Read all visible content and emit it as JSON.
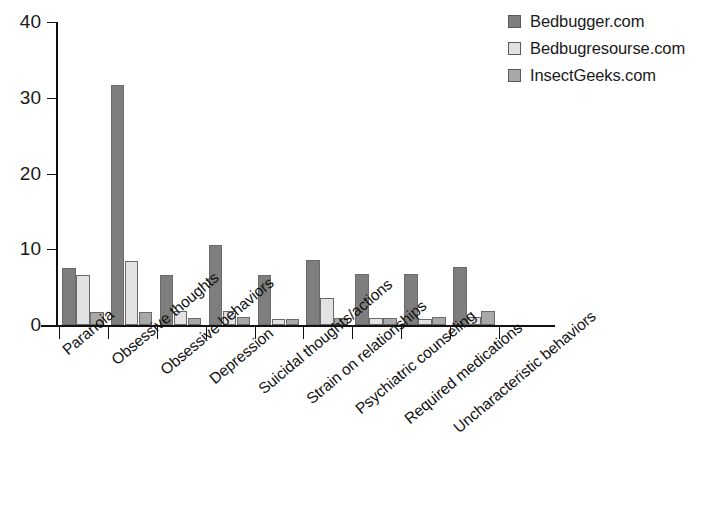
{
  "chart_data": {
    "type": "bar",
    "title": "",
    "subtitle": "",
    "xlabel": "",
    "ylabel": "",
    "ylim": [
      0,
      40
    ],
    "yticks": [
      0,
      10,
      20,
      30,
      40
    ],
    "grid": false,
    "legend_position": "top-right",
    "orientation": "vertical",
    "grouping": "grouped",
    "categories": [
      "Paranoia",
      "Obsessive thoughts",
      "Obsessive behaviors",
      "Depression",
      "Suicidal thoughts/actions",
      "Strain on relationships",
      "Psychiatric counseling",
      "Required medications",
      "Uncharacteristic behaviors"
    ],
    "series": [
      {
        "name": "Bedbugger.com",
        "color": "#7e7e7e",
        "values": [
          7.5,
          31.7,
          6.6,
          10.5,
          6.6,
          8.6,
          6.7,
          6.7,
          7.6
        ]
      },
      {
        "name": "Bedbugresourse.com",
        "color": "#e2e2e2",
        "values": [
          6.6,
          8.5,
          1.8,
          1.8,
          0.8,
          3.6,
          0.9,
          0.8,
          1.1
        ]
      },
      {
        "name": "InsectGeeks.com",
        "color": "#a8a8a8",
        "values": [
          1.7,
          1.7,
          0.9,
          1.0,
          0.8,
          0.9,
          0.9,
          1.0,
          1.8
        ]
      }
    ]
  },
  "legend": {
    "entries": [
      {
        "label": "Bedbugger.com",
        "color": "#7e7e7e"
      },
      {
        "label": "Bedbugresourse.com",
        "color": "#e2e2e2"
      },
      {
        "label": "InsectGeeks.com",
        "color": "#a8a8a8"
      }
    ]
  },
  "axis": {
    "y_tick_labels": [
      "40",
      "30",
      "20",
      "10",
      "0"
    ]
  },
  "colors": {
    "axis": "#111111",
    "bar_outline": "#6b6b6b",
    "text": "#1a1a1a",
    "background": "#ffffff"
  }
}
